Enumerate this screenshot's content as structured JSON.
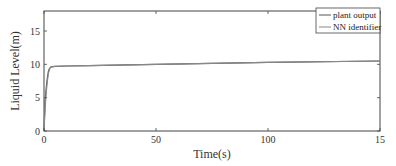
{
  "chart_data": {
    "type": "line",
    "title": "",
    "xlabel": "Time(s)",
    "ylabel": "Liquid Level(m)",
    "xlim": [
      0,
      150
    ],
    "ylim": [
      0,
      18
    ],
    "xticks": [
      0,
      50,
      100,
      150
    ],
    "xtick_labels": [
      "0",
      "50",
      "100",
      "15"
    ],
    "yticks": [
      0,
      5,
      10,
      15
    ],
    "ytick_labels": [
      "0",
      "5",
      "10",
      "15"
    ],
    "grid": false,
    "legend_position": "top-right",
    "series": [
      {
        "name": "plant output",
        "color": "#555555",
        "x": [
          0,
          0.5,
          1,
          1.5,
          2,
          2.5,
          3,
          4,
          5,
          10,
          20,
          50,
          100,
          150
        ],
        "y": [
          0,
          4.5,
          6.5,
          8.0,
          9.0,
          9.4,
          9.6,
          9.65,
          9.7,
          9.75,
          9.8,
          10.0,
          10.3,
          10.5
        ]
      },
      {
        "name": "NN identifier",
        "color": "#888888",
        "x": [
          0,
          0.5,
          1,
          1.5,
          2,
          2.5,
          3,
          4,
          5,
          10,
          20,
          50,
          100,
          150
        ],
        "y": [
          0,
          3.5,
          5.8,
          7.5,
          8.7,
          9.3,
          9.55,
          9.65,
          9.7,
          9.75,
          9.8,
          10.0,
          10.3,
          10.5
        ]
      }
    ]
  },
  "legend": {
    "items": [
      {
        "label": "plant output",
        "color": "#555555"
      },
      {
        "label": "NN identifier",
        "color": "#888888"
      }
    ]
  }
}
